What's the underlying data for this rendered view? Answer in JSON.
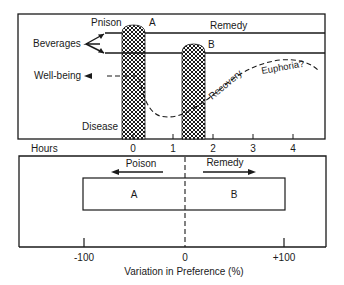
{
  "top_panel": {
    "labels": {
      "poison": "Pnison",
      "a": "A",
      "remedy": "Remedy",
      "b": "B",
      "beverages": "Beverages",
      "well_being": "Well-being",
      "recovery": "Recovery",
      "euphoria": "Euphoria?",
      "disease": "Disease"
    },
    "x_axis": {
      "label": "Hours",
      "ticks": [
        "0",
        "1",
        "2",
        "3",
        "4"
      ]
    }
  },
  "bottom_panel": {
    "labels": {
      "poison": "Poison",
      "remedy": "Remedy",
      "a": "A",
      "b": "B"
    },
    "x_axis": {
      "label": "Variation in Preference (%)",
      "ticks": [
        "-100",
        "0",
        "+100"
      ]
    }
  },
  "colors": {
    "ink": "#1a1a1a",
    "background": "#ffffff"
  }
}
